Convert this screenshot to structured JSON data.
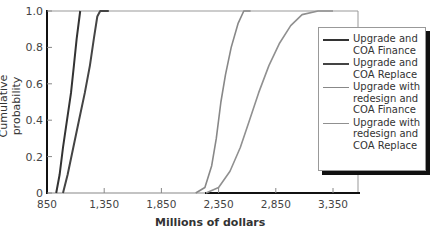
{
  "chart_data": {
    "type": "line",
    "title": "",
    "xlabel": "Millions of dollars",
    "ylabel": "Cumulative probability",
    "xlim": [
      850,
      3550
    ],
    "ylim": [
      0,
      1.0
    ],
    "x_ticks": [
      850,
      1350,
      1850,
      2350,
      2850,
      3350
    ],
    "x_tick_labels": [
      "850",
      "1,350",
      "1,850",
      "2,350",
      "2,850",
      "3,350"
    ],
    "y_ticks": [
      0,
      0.2,
      0.4,
      0.6,
      0.8,
      1.0
    ],
    "y_tick_labels": [
      "0",
      "0.2",
      "0.4",
      "0.6",
      "0.8",
      "1.0"
    ],
    "grid": false,
    "legend_position": "upper right (outside plot edge)",
    "series": [
      {
        "name": "Upgrade and\nCOA Finance",
        "color": "#333333",
        "points": [
          [
            930,
            0
          ],
          [
            960,
            0.1
          ],
          [
            990,
            0.25
          ],
          [
            1025,
            0.4
          ],
          [
            1060,
            0.55
          ],
          [
            1085,
            0.7
          ],
          [
            1110,
            0.85
          ],
          [
            1140,
            1.0
          ]
        ]
      },
      {
        "name": "Upgrade and\nCOA Replace",
        "color": "#444444",
        "points": [
          [
            990,
            0
          ],
          [
            1030,
            0.1
          ],
          [
            1080,
            0.25
          ],
          [
            1130,
            0.4
          ],
          [
            1180,
            0.55
          ],
          [
            1225,
            0.7
          ],
          [
            1260,
            0.85
          ],
          [
            1290,
            0.97
          ],
          [
            1315,
            1.0
          ],
          [
            1390,
            1.0
          ]
        ]
      },
      {
        "name": "Upgrade with\nredesign and\nCOA Finance",
        "color": "#888888",
        "points": [
          [
            2150,
            0
          ],
          [
            2230,
            0.03
          ],
          [
            2290,
            0.15
          ],
          [
            2330,
            0.3
          ],
          [
            2370,
            0.5
          ],
          [
            2410,
            0.65
          ],
          [
            2460,
            0.8
          ],
          [
            2520,
            0.93
          ],
          [
            2570,
            1.0
          ],
          [
            2630,
            1.0
          ]
        ]
      },
      {
        "name": "Upgrade with\nredesign and\nCOA Replace",
        "color": "#909090",
        "points": [
          [
            2240,
            0
          ],
          [
            2350,
            0.03
          ],
          [
            2450,
            0.12
          ],
          [
            2540,
            0.25
          ],
          [
            2620,
            0.4
          ],
          [
            2700,
            0.55
          ],
          [
            2790,
            0.7
          ],
          [
            2880,
            0.82
          ],
          [
            2980,
            0.92
          ],
          [
            3080,
            0.98
          ],
          [
            3220,
            1.0
          ],
          [
            3350,
            1.0
          ]
        ]
      }
    ]
  },
  "legend": {
    "items": [
      {
        "label": "Upgrade and\nCOA Finance",
        "color": "#333333",
        "width": 2.2
      },
      {
        "label": "Upgrade and\nCOA Replace",
        "color": "#444444",
        "width": 2.2
      },
      {
        "label": "Upgrade with\nredesign and\nCOA Finance",
        "color": "#888888",
        "width": 1.6
      },
      {
        "label": "Upgrade with\nredesign and\nCOA Replace",
        "color": "#909090",
        "width": 1.6
      }
    ]
  },
  "axes": {
    "x_title": "Millions of dollars",
    "y_title": "Cumulative probability"
  }
}
